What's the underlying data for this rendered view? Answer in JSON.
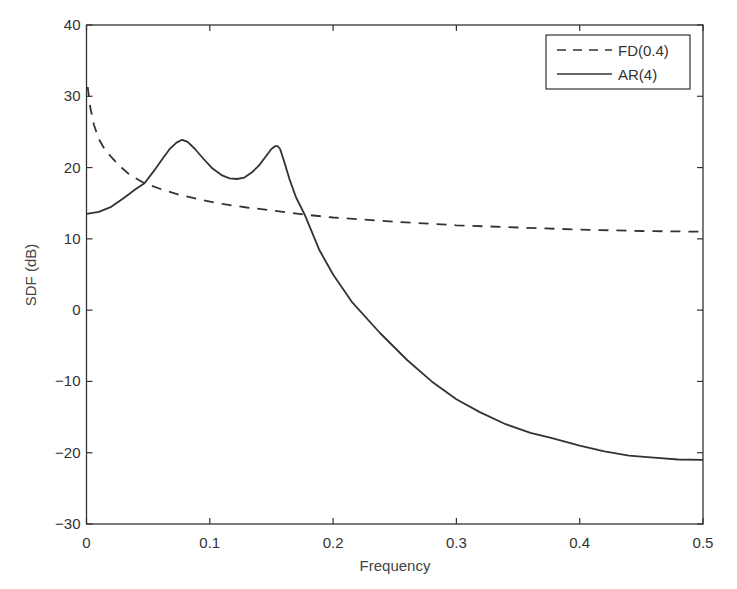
{
  "chart_data": {
    "type": "line",
    "title": "",
    "xlabel": "Frequency",
    "ylabel": "SDF (dB)",
    "xlim": [
      0,
      0.5
    ],
    "ylim": [
      -30,
      40
    ],
    "xticks": [
      0,
      0.1,
      0.2,
      0.3,
      0.4,
      0.5
    ],
    "xtick_labels": [
      "0",
      "0.1",
      "0.2",
      "0.3",
      "0.4",
      "0.5"
    ],
    "yticks": [
      -30,
      -20,
      -10,
      0,
      10,
      20,
      30,
      40
    ],
    "ytick_labels": [
      "−30",
      "−20",
      "−10",
      "0",
      "10",
      "20",
      "30",
      "40"
    ],
    "grid": false,
    "legend_position": "upper right",
    "series": [
      {
        "name": "FD(0.4)",
        "style": "dashed",
        "color": "#333333",
        "x": [
          0.001,
          0.003,
          0.006,
          0.01,
          0.015,
          0.02,
          0.027,
          0.035,
          0.047,
          0.06,
          0.075,
          0.092,
          0.11,
          0.13,
          0.15,
          0.177,
          0.2,
          0.25,
          0.3,
          0.35,
          0.4,
          0.45,
          0.5
        ],
        "y": [
          31.3,
          28.5,
          26.0,
          24.0,
          22.5,
          21.5,
          20.2,
          19.0,
          17.8,
          17.0,
          16.2,
          15.5,
          14.9,
          14.4,
          14.0,
          13.4,
          13.0,
          12.4,
          11.9,
          11.6,
          11.3,
          11.1,
          11.0
        ]
      },
      {
        "name": "AR(4)",
        "style": "solid",
        "color": "#333333",
        "x": [
          0,
          0.01,
          0.02,
          0.03,
          0.04,
          0.047,
          0.055,
          0.062,
          0.068,
          0.073,
          0.0775,
          0.082,
          0.088,
          0.095,
          0.102,
          0.11,
          0.116,
          0.122,
          0.128,
          0.134,
          0.14,
          0.146,
          0.15,
          0.153,
          0.155,
          0.157,
          0.16,
          0.165,
          0.17,
          0.177,
          0.189,
          0.2,
          0.215,
          0.238,
          0.26,
          0.28,
          0.3,
          0.319,
          0.34,
          0.36,
          0.376,
          0.4,
          0.42,
          0.44,
          0.46,
          0.48,
          0.5
        ],
        "y": [
          13.5,
          13.8,
          14.5,
          15.7,
          17.0,
          17.8,
          19.6,
          21.3,
          22.7,
          23.5,
          23.9,
          23.6,
          22.6,
          21.2,
          19.9,
          18.9,
          18.5,
          18.4,
          18.6,
          19.3,
          20.3,
          21.7,
          22.6,
          23.0,
          23.0,
          22.6,
          21.0,
          18.2,
          15.8,
          13.4,
          8.4,
          5.0,
          1.2,
          -3.2,
          -7.0,
          -10.0,
          -12.5,
          -14.3,
          -16.0,
          -17.2,
          -17.9,
          -19.0,
          -19.8,
          -20.4,
          -20.7,
          -20.95,
          -21.0
        ]
      }
    ]
  },
  "legend": {
    "items": [
      {
        "label": "FD(0.4)",
        "style": "dashed"
      },
      {
        "label": "AR(4)",
        "style": "solid"
      }
    ]
  },
  "axes": {
    "xlabel": "Frequency",
    "ylabel": "SDF (dB)"
  }
}
